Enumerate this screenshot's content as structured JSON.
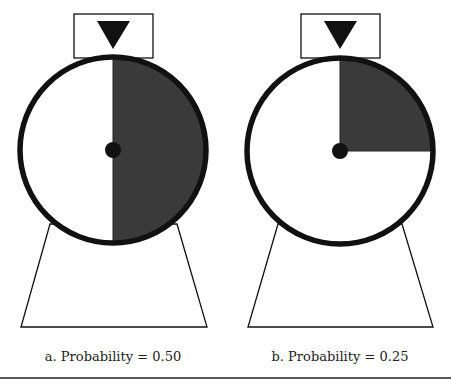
{
  "figure": {
    "panels": [
      {
        "id": "a",
        "caption": "a.  Probability = 0.50",
        "probability": 0.5,
        "shaded_fraction": 0.5
      },
      {
        "id": "b",
        "caption": "b.  Probability = 0.25",
        "probability": 0.25,
        "shaded_fraction": 0.25
      }
    ],
    "colors": {
      "shade": "#3a3a3a",
      "stroke": "#111111",
      "background": "#ffffff"
    }
  }
}
